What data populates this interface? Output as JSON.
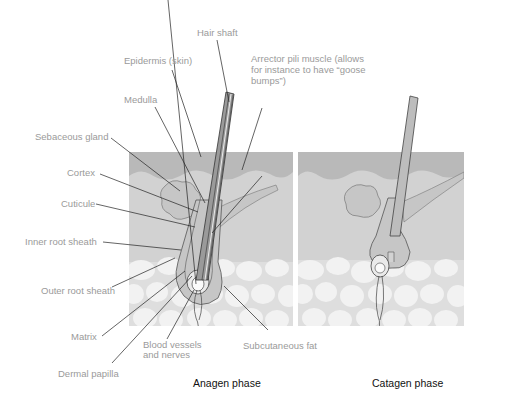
{
  "diagram": {
    "type": "anatomical-illustration",
    "colors": {
      "epidermis": "#b9b9b9",
      "dermis": "#d2d2d2",
      "fat_background": "#dedede",
      "fat_cells": "#f2f2f2",
      "follicle": "#c6c6c6",
      "label_text": "#9a9a9a",
      "phase_text": "#111111",
      "leader_line": "#222222"
    },
    "labels": {
      "hair_shaft": "Hair shaft",
      "epidermis": "Epidermis (skin)",
      "arrector": "Arrector  pili muscle (allows for instance to have “goose bumps”)",
      "medulla": "Medulla",
      "sebaceous": "Sebaceous gland",
      "cortex": "Cortex",
      "cuticule": "Cuticule",
      "inner_root": "Inner root sheath",
      "outer_root": "Outer root sheath",
      "matrix": "Matrix",
      "blood_vessels": "Blood  vessels and  nerves",
      "dermal_papilla": "Dermal papilla",
      "subcutaneous": "Subcutaneous fat"
    },
    "panels": [
      {
        "name": "anagen",
        "caption": "Anagen phase"
      },
      {
        "name": "catagen",
        "caption": "Catagen phase"
      }
    ]
  }
}
